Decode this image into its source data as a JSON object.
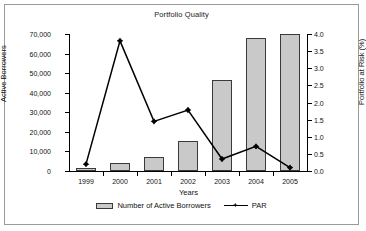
{
  "chart_data": {
    "type": "bar",
    "title": "Portfolio Quality",
    "xlabel": "Years",
    "ylabel": "Active Borrowers",
    "y2label": "Portfolio at Risk (%)",
    "categories": [
      "1999",
      "2000",
      "2001",
      "2002",
      "2003",
      "2004",
      "2005"
    ],
    "ylim": [
      0,
      70000
    ],
    "y2lim": [
      0,
      4.0
    ],
    "grid": false,
    "legend_position": "bottom",
    "yticks": [
      "0",
      "10,000",
      "20,000",
      "30,000",
      "40,000",
      "50,000",
      "60,000",
      "70,000"
    ],
    "y2ticks": [
      "0.0",
      "0.5",
      "1.0",
      "1.5",
      "2.0",
      "2.5",
      "3.0",
      "3.5",
      "4.0"
    ],
    "series": [
      {
        "name": "Number of Active Borrowers",
        "type": "bar",
        "axis": "left",
        "color": "#c9c9c9",
        "edge_color": "#3a3a3a",
        "values": [
          1500,
          4000,
          7200,
          15500,
          46500,
          68000,
          69800
        ]
      },
      {
        "name": "PAR",
        "type": "line",
        "axis": "right",
        "color": "#000000",
        "marker": "diamond",
        "values": [
          0.2,
          3.8,
          1.45,
          1.78,
          0.35,
          0.72,
          0.1
        ]
      }
    ]
  },
  "legend": {
    "bars_label": "Number of Active Borrowers",
    "line_label": "PAR"
  }
}
